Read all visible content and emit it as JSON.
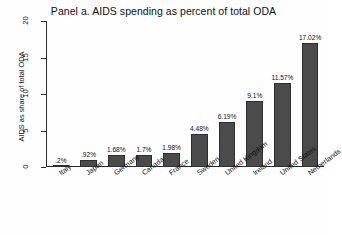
{
  "chart_data": {
    "type": "bar",
    "title": "Panel a. AIDS spending as percent of total ODA",
    "xlabel": "",
    "ylabel": "AIDS as share of total ODA",
    "ylim": [
      0,
      20
    ],
    "yticks": [
      0,
      5,
      10,
      15,
      20
    ],
    "ytick_labels": [
      "0",
      "5",
      "10",
      "15",
      "20"
    ],
    "grid": false,
    "legend": "none",
    "categories": [
      "Italy",
      "Japan",
      "Germany",
      "Canada",
      "France",
      "Sweden",
      "United Kingdom",
      "Ireland",
      "United States",
      "Netherlands"
    ],
    "values": [
      0.2,
      0.92,
      1.68,
      1.7,
      1.98,
      4.48,
      6.19,
      9.1,
      11.57,
      17.02
    ],
    "value_labels": [
      ".2%",
      ".92%",
      "1.68%",
      "1.7%",
      "1.98%",
      "4.48%",
      "6.19%",
      "9.1%",
      "11.57%",
      "17.02%"
    ],
    "bar_color": "#4b4b4b",
    "bar_edge_color": "#2e2e2e",
    "axis_color": "#2b2b2b",
    "background_color": "#fefefe"
  }
}
